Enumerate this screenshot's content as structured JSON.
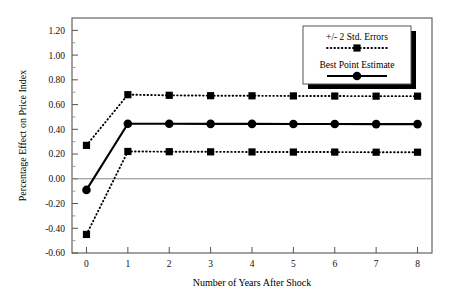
{
  "chart_data": {
    "type": "line",
    "title": "",
    "xlabel": "Number of Years After Shock",
    "ylabel": "Percentage Effect on Price Index",
    "x": [
      0,
      1,
      2,
      3,
      4,
      5,
      6,
      7,
      8
    ],
    "xlim": [
      -0.35,
      8.35
    ],
    "ylim": [
      -0.6,
      1.3
    ],
    "xticks": [
      "0",
      "1",
      "2",
      "3",
      "4",
      "5",
      "6",
      "7",
      "8"
    ],
    "yticks": [
      "1.20",
      "1.00",
      "0.80",
      "0.60",
      "0.40",
      "0.20",
      "0.00",
      "-0.20",
      "-0.40",
      "-0.60"
    ],
    "ytick_values": [
      1.2,
      1.0,
      0.8,
      0.6,
      0.4,
      0.2,
      0.0,
      -0.2,
      -0.4,
      -0.6
    ],
    "grid": false,
    "zero_line": true,
    "legend_position": "top-right",
    "series": [
      {
        "name": "+/- 2 Std. Errors (upper)",
        "style": "dotted",
        "marker": "square",
        "values": [
          0.27,
          0.68,
          0.675,
          0.672,
          0.671,
          0.67,
          0.669,
          0.668,
          0.668
        ]
      },
      {
        "name": "Best Point Estimate",
        "style": "solid",
        "marker": "circle",
        "values": [
          -0.09,
          0.445,
          0.445,
          0.444,
          0.444,
          0.443,
          0.443,
          0.442,
          0.442
        ]
      },
      {
        "name": "+/- 2 Std. Errors (lower)",
        "style": "dotted",
        "marker": "square",
        "values": [
          -0.45,
          0.221,
          0.219,
          0.218,
          0.217,
          0.216,
          0.216,
          0.215,
          0.215
        ]
      }
    ]
  },
  "legend": {
    "entries": [
      {
        "label": "+/- 2 Std. Errors",
        "style": "dotted",
        "marker": "square"
      },
      {
        "label": "Best Point Estimate",
        "style": "solid",
        "marker": "circle"
      }
    ]
  },
  "colors": {
    "series": "#000000",
    "frame": "#555555",
    "background": "#ffffff"
  }
}
